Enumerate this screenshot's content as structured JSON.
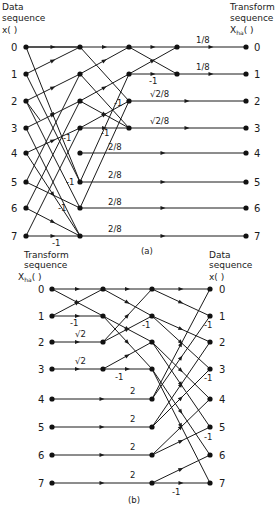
{
  "diagram_a": {
    "caption": "(a)",
    "left_title_line1": "Data",
    "left_title_line2": "sequence",
    "left_title_line3": "x(   )",
    "right_title_line1": "Transform",
    "right_title_line2": "sequence",
    "right_title_line3": "X",
    "right_title_sub": "ha",
    "right_title_paren": "(   )",
    "input_indices": [
      "0",
      "1",
      "2",
      "3",
      "4",
      "5",
      "6",
      "7"
    ],
    "output_indices": [
      "0",
      "1",
      "2",
      "3",
      "4",
      "5",
      "6",
      "7"
    ],
    "output_weights": [
      "1/8",
      "1/8",
      "√2/8",
      "√2/8",
      "2/8",
      "2/8",
      "2/8",
      "2/8"
    ],
    "minus_one_label": "-1"
  },
  "diagram_b": {
    "caption": "(b)",
    "left_title_line1": "Transform",
    "left_title_line2": "sequence",
    "left_title_line3": "X",
    "left_title_sub": "ha",
    "left_title_paren": "(   )",
    "right_title_line1": "Data",
    "right_title_line2": "sequence",
    "right_title_line3": "x(   )",
    "input_indices": [
      "0",
      "1",
      "2",
      "3",
      "4",
      "5",
      "6",
      "7"
    ],
    "output_indices": [
      "0",
      "1",
      "2",
      "3",
      "4",
      "5",
      "6",
      "7"
    ],
    "input_weights": [
      "",
      "",
      "√2",
      "√2",
      "2",
      "2",
      "2",
      "2"
    ],
    "minus_one_label": "-1"
  }
}
